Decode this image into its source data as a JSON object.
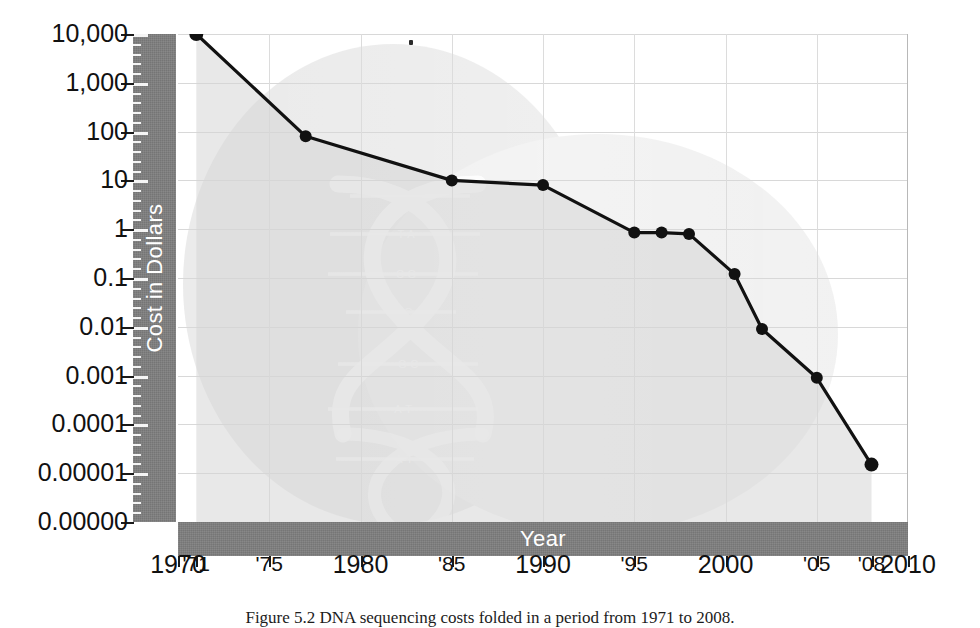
{
  "figure": {
    "caption": "Figure 5.2    DNA sequencing costs folded in a period from 1971 to 2008."
  },
  "axes": {
    "y_axis_title": "Cost in Dollars",
    "x_axis_title": "Year",
    "y_tick_labels": [
      "10,000",
      "1,000",
      "100",
      "10",
      "1",
      "0.1",
      "0.01",
      "0.001",
      "0.0001",
      "0.00001",
      "0.00000"
    ],
    "x_tick_labels": [
      "1970",
      "'71",
      "'75",
      "1980",
      "'85",
      "1990",
      "'95",
      "2000",
      "'05",
      "'08",
      "2010"
    ]
  },
  "watermark": {
    "name": "dna-double-helix",
    "base_pair_labels": [
      "G-C",
      "T-A",
      "C-G",
      "A-T",
      "G-C",
      "A-T",
      "A-T"
    ]
  },
  "colors": {
    "axis_bar": "#7c7c7c",
    "line": "#111111",
    "fill": "#d6d6d6",
    "gridline": "#d8d8d8",
    "background": "#ffffff"
  },
  "chart_data": {
    "type": "line",
    "title": "",
    "xlabel": "Year",
    "ylabel": "Cost in Dollars",
    "yscale": "log",
    "ylim": [
      1e-06,
      10000
    ],
    "xlim": [
      1970,
      2010
    ],
    "grid": true,
    "legend": "none",
    "y_ticks": [
      10000,
      1000,
      100,
      10,
      1,
      0.1,
      0.01,
      0.001,
      0.0001,
      1e-05,
      1e-06
    ],
    "y_tick_labels": [
      "10,000",
      "1,000",
      "100",
      "10",
      "1",
      "0.1",
      "0.01",
      "0.001",
      "0.0001",
      "0.00001",
      "0.00000"
    ],
    "x_ticks": [
      1970,
      1971,
      1975,
      1980,
      1985,
      1990,
      1995,
      2000,
      2005,
      2008,
      2010
    ],
    "x_tick_labels": [
      "1970",
      "'71",
      "'75",
      "1980",
      "'85",
      "1990",
      "'95",
      "2000",
      "'05",
      "'08",
      "2010"
    ],
    "series": [
      {
        "name": "Cost per base of DNA sequencing",
        "x": [
          1971,
          1977,
          1985,
          1990,
          1995,
          1996.5,
          1998,
          2000.5,
          2002,
          2005,
          2008
        ],
        "values": [
          10000,
          80,
          10,
          8,
          0.85,
          0.85,
          0.8,
          0.12,
          0.009,
          0.0009,
          1.5e-05
        ],
        "points": [
          {
            "year": 1971,
            "cost": 10000
          },
          {
            "year": 1977,
            "cost": 80
          },
          {
            "year": 1985,
            "cost": 10
          },
          {
            "year": 1990,
            "cost": 8
          },
          {
            "year": 1995,
            "cost": 0.85
          },
          {
            "year": 1996.5,
            "cost": 0.85
          },
          {
            "year": 1998,
            "cost": 0.8
          },
          {
            "year": 2000.5,
            "cost": 0.12
          },
          {
            "year": 2002,
            "cost": 0.009
          },
          {
            "year": 2005,
            "cost": 0.0009
          },
          {
            "year": 2008,
            "cost": 1.5e-05
          }
        ]
      }
    ]
  }
}
